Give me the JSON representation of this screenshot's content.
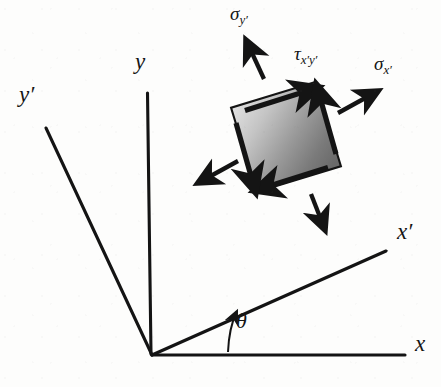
{
  "figure": {
    "background_color": "#fdfdfc",
    "ink_color": "#141414"
  },
  "axes": {
    "origin": {
      "x": 152,
      "y": 355
    },
    "items": [
      {
        "id": "x",
        "label": "x",
        "label_sub": "",
        "prime": false,
        "label_x": 415,
        "label_y": 344,
        "line": {
          "x1": 152,
          "y1": 355,
          "x2": 405,
          "y2": 355
        },
        "description": "horizontal reference axis"
      },
      {
        "id": "y",
        "label": "y",
        "label_sub": "",
        "prime": false,
        "label_x": 136,
        "label_y": 62,
        "line": {
          "x1": 147,
          "y1": 93,
          "x2": 150,
          "y2": 353
        },
        "description": "vertical reference axis"
      },
      {
        "id": "x-prime",
        "label": "x",
        "label_sub": "",
        "prime": true,
        "label_x": 398,
        "label_y": 232,
        "line": {
          "x1": 152,
          "y1": 355,
          "x2": 386,
          "y2": 251
        },
        "description": "rotated axis at angle theta from x"
      },
      {
        "id": "y-prime",
        "label": "y",
        "label_sub": "",
        "prime": true,
        "label_x": 20,
        "label_y": 95,
        "line": {
          "x1": 46,
          "y1": 128,
          "x2": 152,
          "y2": 355
        },
        "description": "rotated axis perpendicular to x-prime"
      }
    ]
  },
  "angle": {
    "symbol": "θ",
    "label_x": 237,
    "label_y": 320,
    "arc_description": "curved arrow from x axis up to x-prime axis",
    "value_degrees": 24
  },
  "element": {
    "description": "rotated square stress element with gradient shading",
    "center": {
      "x": 286,
      "y": 137
    },
    "size": 88,
    "rotation_degrees": -17,
    "fill_light": "#d8d8d8",
    "fill_dark": "#6e6e6e",
    "edge_color": "#141414"
  },
  "stresses": [
    {
      "id": "sigma-x-prime",
      "symbol": "σ",
      "subscript": "x",
      "subscript_prime": true,
      "kind": "normal",
      "label_x": 376,
      "label_y": 64,
      "direction": "outward to the right, normal to the x-prime face",
      "arrow": {
        "x1": 337,
        "y1": 113,
        "x2": 380,
        "y2": 89
      }
    },
    {
      "id": "sigma-y-prime",
      "symbol": "σ",
      "subscript": "y",
      "subscript_prime": true,
      "kind": "normal",
      "label_x": 232,
      "label_y": 12,
      "direction": "outward upward, normal to the y-prime face",
      "arrow": {
        "x1": 263,
        "y1": 81,
        "x2": 245,
        "y2": 37
      }
    },
    {
      "id": "tau-x-prime-y-prime",
      "symbol": "τ",
      "subscript": "x",
      "subscript_prime": true,
      "subscript2": "y",
      "subscript2_prime": true,
      "kind": "shear",
      "label_x": 296,
      "label_y": 52,
      "direction": "along the top face toward upper right",
      "arrow": {
        "x1": 248,
        "y1": 109,
        "x2": 322,
        "y2": 86
      }
    }
  ],
  "arrows": {
    "normal": [
      {
        "name": "sigma-x-prime-arrow",
        "x1": 337,
        "y1": 113,
        "x2": 381,
        "y2": 89
      },
      {
        "name": "sigma-y-prime-arrow",
        "x1": 263,
        "y1": 81,
        "x2": 245,
        "y2": 37
      },
      {
        "name": "sigma-x-prime-opposite-arrow",
        "x1": 239,
        "y1": 162,
        "x2": 196,
        "y2": 186
      },
      {
        "name": "sigma-y-prime-opposite-arrow",
        "x1": 312,
        "y1": 192,
        "x2": 326,
        "y2": 232
      }
    ],
    "shear": [
      {
        "name": "shear-top-arrow",
        "x1": 248,
        "y1": 109,
        "x2": 322,
        "y2": 86
      },
      {
        "name": "shear-right-arrow",
        "x1": 337,
        "y1": 152,
        "x2": 315,
        "y2": 82
      },
      {
        "name": "shear-bottom-arrow",
        "x1": 325,
        "y1": 169,
        "x2": 251,
        "y2": 192
      },
      {
        "name": "shear-left-arrow",
        "x1": 236,
        "y1": 126,
        "x2": 258,
        "y2": 196
      }
    ]
  }
}
